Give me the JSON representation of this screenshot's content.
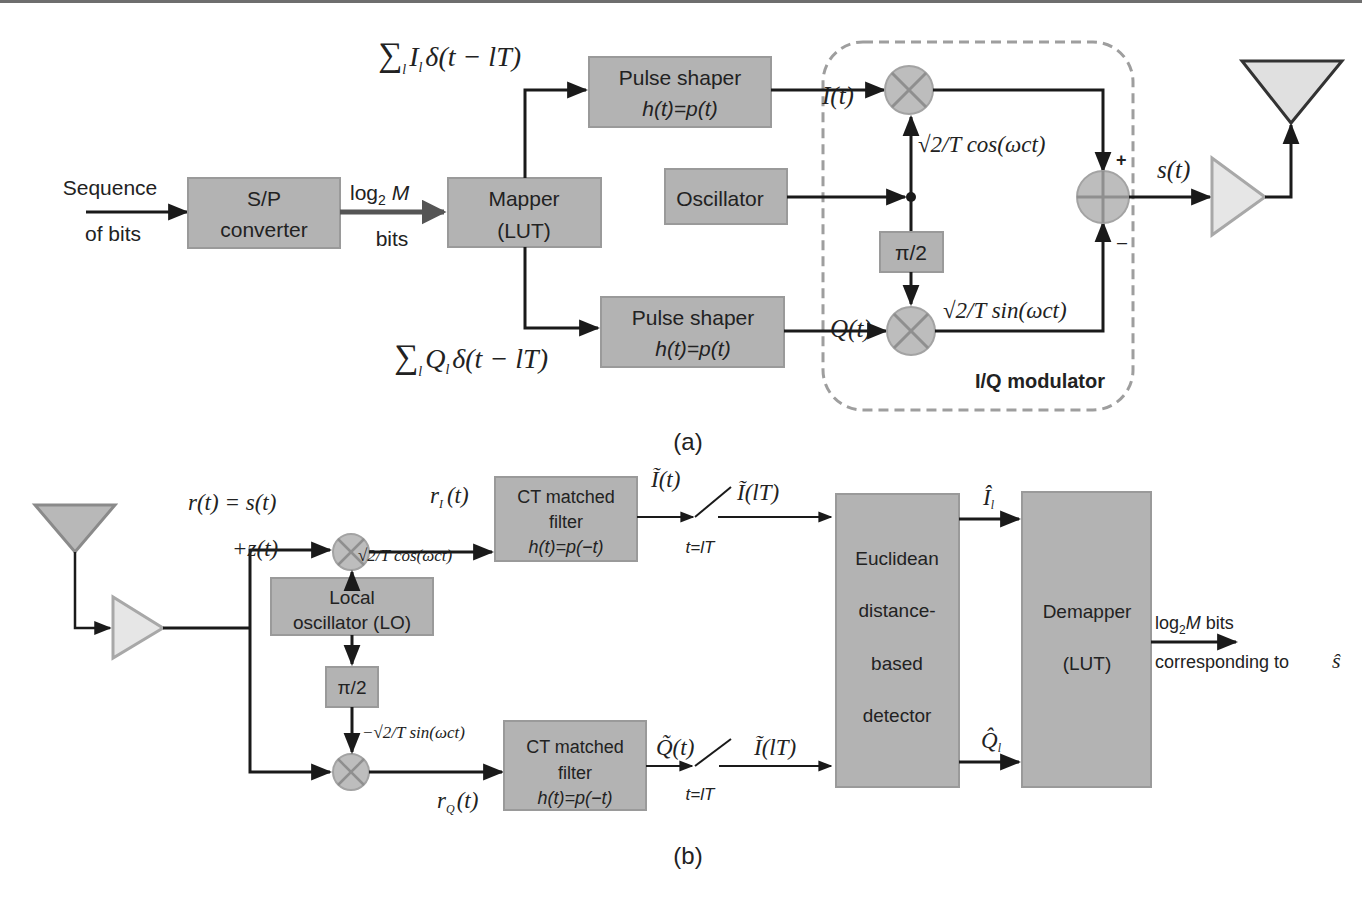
{
  "colors": {
    "block_fill": "#b3b3b3",
    "block_stroke": "#9a9a9a",
    "line": "#1a1a1a",
    "mixer_fill": "#bdbdbd",
    "mixer_stroke": "#a3a3a3",
    "amp_fill": "#e6e6e6",
    "amp_stroke": "#a8a8a8",
    "antenna_fill": "#c9c9c9",
    "dashed_box": "#9e9e9e"
  },
  "transmitter": {
    "caption": "(a)",
    "input_label_line1": "Sequence",
    "input_label_line2": "of bits",
    "sp_converter": {
      "line1": "S/P",
      "line2": "converter"
    },
    "log_label": "log",
    "log_sub": "2",
    "log_M": " M",
    "bits_label": "bits",
    "mapper": {
      "line1": "Mapper",
      "line2": "(LUT)"
    },
    "sum_I": {
      "sigma": "∑",
      "sub": "l",
      "body": "I",
      "body_sub": "l",
      "rest": "δ(t − lT)"
    },
    "sum_Q": {
      "sigma": "∑",
      "sub": "l",
      "body": "Q",
      "body_sub": "l",
      "rest": "δ(t − lT)"
    },
    "pulse_shaper_top": {
      "line1": "Pulse shaper",
      "line2": "h(t)=p(t)"
    },
    "pulse_shaper_bottom": {
      "line1": "Pulse shaper",
      "line2": "h(t)=p(t)"
    },
    "oscillator": "Oscillator",
    "phase_shift": "π/2",
    "I_t": "I(t)",
    "Q_t": "Q(t)",
    "cos_label": "√2/T cos(ωct)",
    "sin_label": "√2/T sin(ωct)",
    "plus": "+",
    "minus": "–",
    "s_t": "s(t)",
    "iq_modulator": "I/Q modulator"
  },
  "receiver": {
    "caption": "(b)",
    "r_t": "r(t) = s(t)",
    "z_t": "+z(t)",
    "rI_t": "rI (t)",
    "rQ_t": "rQ (t)",
    "cos_label": "√2/T cos(ωct)",
    "neg_sin_label": "−√2/T sin(ωct)",
    "local_osc": {
      "line1": "Local",
      "line2": "oscillator (LO)"
    },
    "phase_shift": "π/2",
    "mf_top": {
      "line1": "CT matched",
      "line2": "filter",
      "line3": "h(t)=p(−t)"
    },
    "mf_bottom": {
      "line1": "CT matched",
      "line2": "filter",
      "line3": "h(t)=p(−t)"
    },
    "I_tilde_t": "Ĩ(t)",
    "Q_tilde_t": "Q̃(t)",
    "I_tilde_lT_top": "Ĩ(lT)",
    "I_tilde_lT_bottom": "Ĩ(lT)",
    "sample_top": "t=lT",
    "sample_bottom": "t=lT",
    "detector": {
      "line1": "Euclidean",
      "line2": "distance-",
      "line3": "based",
      "line4": "detector"
    },
    "I_hat": "Î",
    "I_hat_sub": "l",
    "Q_hat": "Q̂",
    "Q_hat_sub": "l",
    "demapper": {
      "line1": "Demapper",
      "line2": "(LUT)"
    },
    "output_line1_a": "log",
    "output_line1_sub": "2",
    "output_line1_M": "M",
    "output_line1_b": " bits",
    "output_line2": "corresponding to",
    "output_s_hat": "ŝ"
  }
}
